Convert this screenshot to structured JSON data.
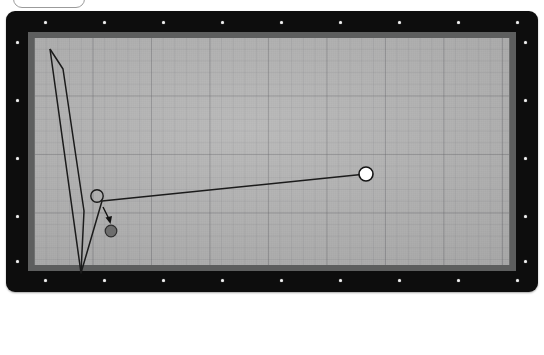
{
  "app": {
    "title": "Billiards Shot Diagram",
    "top_widget_label": ""
  },
  "table": {
    "rail_color": "#0d0d0d",
    "cushion_color": "#6f7070",
    "cloth_color": "#b4b4b4",
    "grid_line_color": "#5a5a5f",
    "diamonds_long_rail": 9,
    "diamonds_short_rail": 5
  },
  "shot": {
    "cue_ball": {
      "name": "cue-ball",
      "x": 360,
      "y": 163,
      "r": 7.5,
      "fill": "#ffffff",
      "stroke": "#1a1a1a"
    },
    "ghost_ball": {
      "name": "ghost-ball",
      "x": 91,
      "y": 185,
      "r": 6.5,
      "fill": "none",
      "stroke": "#1a1a1a"
    },
    "object_ball": {
      "name": "object-ball",
      "x": 105,
      "y": 220,
      "r": 6,
      "fill": "#6b6b6b",
      "stroke": "#2a2a2a"
    },
    "aim_line": "360,163 96,190",
    "cue_path": "96,190 75,262 44,38",
    "rail_path": "44,38 57,58 78,200 75,262",
    "contact_arrow": {
      "from": "97,196",
      "to": "104,211"
    }
  },
  "toolbar": {
    "spin_label": "english-spin-indicator",
    "spin_dot": {
      "x": -0.42,
      "y": 0.3
    },
    "ball_count": "2/5",
    "speed_label": "AA",
    "direction_label": "arrow-left",
    "rail_count": "4"
  }
}
